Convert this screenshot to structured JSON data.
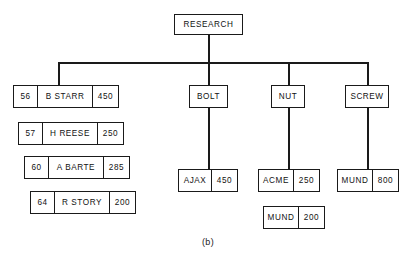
{
  "figure": {
    "caption": "(b)",
    "line_color": "#1a1a1a",
    "text_color": "#111111",
    "background": "#ffffff"
  },
  "tree": {
    "root": {
      "label": "RESEARCH"
    },
    "employees": [
      {
        "id": "56",
        "name": "B STARR",
        "amount": "450"
      },
      {
        "id": "57",
        "name": "H REESE",
        "amount": "250"
      },
      {
        "id": "60",
        "name": "A BARTE",
        "amount": "285"
      },
      {
        "id": "64",
        "name": "R STORY",
        "amount": "200"
      }
    ],
    "parts": [
      {
        "label": "BOLT",
        "suppliers": [
          {
            "name": "AJAX",
            "amount": "450"
          }
        ]
      },
      {
        "label": "NUT",
        "suppliers": [
          {
            "name": "ACME",
            "amount": "250"
          },
          {
            "name": "MUND",
            "amount": "200"
          }
        ]
      },
      {
        "label": "SCREW",
        "suppliers": [
          {
            "name": "MUND",
            "amount": "800"
          }
        ]
      }
    ]
  }
}
